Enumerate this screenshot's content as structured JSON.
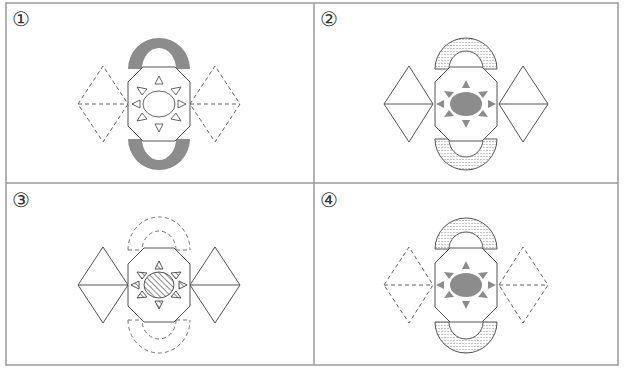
{
  "figure": {
    "layout": "2x2 grid of option panels",
    "border_color": "#9a9a9a",
    "line_color": "#555555",
    "fill_gray": "#8c8c8c",
    "panels": [
      {
        "label": "①",
        "center": [
          159,
          104
        ],
        "wings": "dashed",
        "arches": "solid-gray",
        "sun": "outline"
      },
      {
        "label": "②",
        "center": [
          466,
          104
        ],
        "wings": "solid",
        "arches": "dotted-fill",
        "sun": "gray"
      },
      {
        "label": "③",
        "center": [
          159,
          285
        ],
        "wings": "solid",
        "arches": "dashed-outline",
        "sun": "hatched"
      },
      {
        "label": "④",
        "center": [
          466,
          285
        ],
        "wings": "dashed",
        "arches": "dotted-fill",
        "sun": "gray"
      }
    ]
  }
}
